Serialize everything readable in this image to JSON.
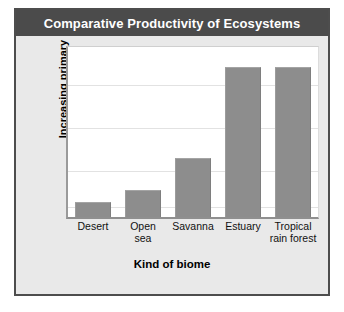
{
  "figure": {
    "title": "Comparative Productivity of Ecosystems",
    "title_bar_color": "#4b4b4b",
    "title_text_color": "#ffffff",
    "panel_background": "#e9e9e9",
    "panel_border_color": "#4d4d4d",
    "plot_background": "#ffffff",
    "bar_color": "#8d8d8d",
    "gridline_color": "#e2e2e2"
  },
  "chart_data": {
    "type": "bar",
    "title": "Comparative Productivity of Ecosystems",
    "xlabel": "Kind of biome",
    "ylabel": "Increasing primary productivity",
    "ylabel_lines": [
      "Increasing primary",
      "productivity"
    ],
    "categories": [
      "Desert",
      "Open sea",
      "Savanna",
      "Estuary",
      "Tropical rain forest"
    ],
    "category_lines": [
      [
        "Desert"
      ],
      [
        "Open",
        "sea"
      ],
      [
        "Savanna"
      ],
      [
        "Estuary"
      ],
      [
        "Tropical",
        "rain forest"
      ]
    ],
    "values": [
      9,
      16,
      35,
      88,
      88
    ],
    "ylim": [
      0,
      100
    ],
    "ytick_labels": [],
    "gridlines": true,
    "gridline_count": 4,
    "legend": null,
    "legend_position": "none",
    "annotations": []
  }
}
